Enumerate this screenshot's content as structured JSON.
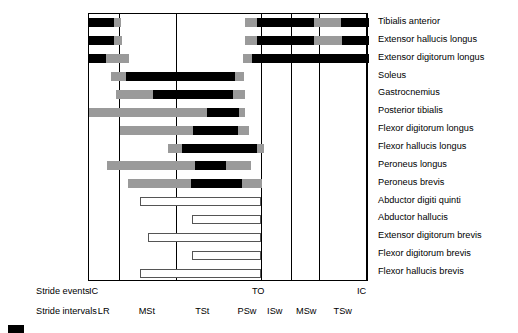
{
  "chart_data": {
    "type": "bar",
    "title": "",
    "xlabel": "Percent of gait cycle",
    "ylabel": "",
    "xlim": [
      0,
      100
    ],
    "grid": true,
    "legend_position": "none",
    "axis_gridlines_percent": [
      0,
      10.7,
      31.1,
      61.4,
      72.1,
      82.1,
      98.9,
      100
    ],
    "stride_events": [
      {
        "label": "IC",
        "percent": 0
      },
      {
        "label": "TO",
        "percent": 61.4
      },
      {
        "label": "IC",
        "percent": 100
      }
    ],
    "stride_intervals": [
      {
        "label": "LR",
        "start": 0,
        "end": 10.7
      },
      {
        "label": "MSt",
        "start": 10.7,
        "end": 31.1
      },
      {
        "label": "TSt",
        "start": 31.1,
        "end": 51.0
      },
      {
        "label": "PSw",
        "start": 51.0,
        "end": 61.4
      },
      {
        "label": "ISw",
        "start": 61.4,
        "end": 72.1
      },
      {
        "label": "MSw",
        "start": 72.1,
        "end": 82.1
      },
      {
        "label": "TSw",
        "start": 82.1,
        "end": 98.9
      }
    ],
    "shading_legend": {
      "black": "strong activity",
      "gray": "moderate activity",
      "white": "variable / low activity"
    },
    "muscles": [
      {
        "name": "Tibialis anterior",
        "segments": [
          {
            "shade": "black",
            "start": 0.0,
            "end": 8.9
          },
          {
            "shade": "gray",
            "start": 8.9,
            "end": 11.4
          },
          {
            "shade": "gray",
            "start": 55.7,
            "end": 60.0
          },
          {
            "shade": "black",
            "start": 60.0,
            "end": 80.4
          },
          {
            "shade": "gray",
            "start": 80.4,
            "end": 90.0
          },
          {
            "shade": "black",
            "start": 90.0,
            "end": 100.0
          }
        ]
      },
      {
        "name": "Extensor hallucis longus",
        "segments": [
          {
            "shade": "black",
            "start": 0.0,
            "end": 8.9
          },
          {
            "shade": "gray",
            "start": 8.9,
            "end": 11.8
          },
          {
            "shade": "gray",
            "start": 55.7,
            "end": 60.0
          },
          {
            "shade": "black",
            "start": 60.0,
            "end": 80.4
          },
          {
            "shade": "gray",
            "start": 80.4,
            "end": 90.4
          },
          {
            "shade": "black",
            "start": 90.4,
            "end": 100.0
          }
        ]
      },
      {
        "name": "Extensor digitorum longus",
        "segments": [
          {
            "shade": "black",
            "start": 0.0,
            "end": 6.1
          },
          {
            "shade": "gray",
            "start": 6.1,
            "end": 14.3
          },
          {
            "shade": "gray",
            "start": 55.0,
            "end": 58.2
          },
          {
            "shade": "black",
            "start": 58.2,
            "end": 100.0
          }
        ]
      },
      {
        "name": "Soleus",
        "segments": [
          {
            "shade": "gray",
            "start": 7.9,
            "end": 13.2
          },
          {
            "shade": "black",
            "start": 13.2,
            "end": 52.1
          },
          {
            "shade": "gray",
            "start": 52.1,
            "end": 55.4
          }
        ]
      },
      {
        "name": "Gastrocnemius",
        "segments": [
          {
            "shade": "gray",
            "start": 9.6,
            "end": 22.9
          },
          {
            "shade": "black",
            "start": 22.9,
            "end": 51.4
          },
          {
            "shade": "gray",
            "start": 51.4,
            "end": 55.7
          }
        ]
      },
      {
        "name": "Posterior tibialis",
        "segments": [
          {
            "shade": "gray",
            "start": 0.0,
            "end": 42.1
          },
          {
            "shade": "black",
            "start": 42.1,
            "end": 53.6
          },
          {
            "shade": "gray",
            "start": 53.6,
            "end": 55.7
          }
        ]
      },
      {
        "name": "Flexor digitorum longus",
        "segments": [
          {
            "shade": "gray",
            "start": 11.1,
            "end": 37.1
          },
          {
            "shade": "black",
            "start": 37.1,
            "end": 53.2
          },
          {
            "shade": "gray",
            "start": 53.2,
            "end": 57.1
          }
        ]
      },
      {
        "name": "Flexor hallucis longus",
        "segments": [
          {
            "shade": "gray",
            "start": 28.2,
            "end": 33.2
          },
          {
            "shade": "black",
            "start": 33.2,
            "end": 60.0
          },
          {
            "shade": "gray",
            "start": 60.0,
            "end": 62.5
          }
        ]
      },
      {
        "name": "Peroneus longus",
        "segments": [
          {
            "shade": "gray",
            "start": 6.4,
            "end": 37.9
          },
          {
            "shade": "black",
            "start": 37.9,
            "end": 48.9
          },
          {
            "shade": "gray",
            "start": 48.9,
            "end": 57.9
          }
        ]
      },
      {
        "name": "Peroneus brevis",
        "segments": [
          {
            "shade": "gray",
            "start": 13.9,
            "end": 36.4
          },
          {
            "shade": "black",
            "start": 36.4,
            "end": 54.6
          },
          {
            "shade": "gray",
            "start": 54.6,
            "end": 61.8
          }
        ]
      },
      {
        "name": "Abductor digiti quinti",
        "segments": [
          {
            "shade": "white",
            "start": 18.2,
            "end": 61.4
          }
        ]
      },
      {
        "name": "Abductor hallucis",
        "segments": [
          {
            "shade": "white",
            "start": 36.8,
            "end": 61.4
          }
        ]
      },
      {
        "name": "Extensor digitorum brevis",
        "segments": [
          {
            "shade": "white",
            "start": 21.1,
            "end": 61.4
          }
        ]
      },
      {
        "name": "Flexor digitorum brevis",
        "segments": [
          {
            "shade": "white",
            "start": 36.8,
            "end": 61.4
          }
        ]
      },
      {
        "name": "Flexor hallucis brevis",
        "segments": [
          {
            "shade": "white",
            "start": 18.2,
            "end": 61.4
          }
        ]
      }
    ]
  },
  "axis": {
    "events_caption": "Stride events",
    "intervals_caption": "Stride intervals"
  },
  "colors": {
    "strong": "#000000",
    "moderate": "#9a9a9a",
    "low": "#ffffff",
    "frame": "#000000"
  }
}
